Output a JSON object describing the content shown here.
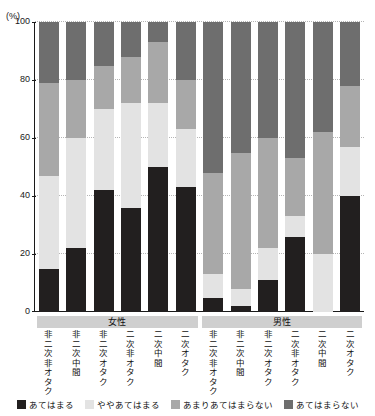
{
  "clipped_title": "",
  "axis": {
    "unit_label": "(%)",
    "y_ticks": [
      "100",
      "80",
      "60",
      "40",
      "20",
      "0"
    ],
    "y_min": 0,
    "y_max": 100
  },
  "groups": [
    {
      "label": "女性",
      "start": 0,
      "count": 6
    },
    {
      "label": "男性",
      "start": 6,
      "count": 6
    }
  ],
  "legend": {
    "items": [
      {
        "label": "あてはまる",
        "color": "#221f1f"
      },
      {
        "label": "ややあてはまる",
        "color": "#e3e3e3"
      },
      {
        "label": "あまりあてはまらない",
        "color": "#a8a8a8"
      },
      {
        "label": "あてはまらない",
        "color": "#6e6e6e"
      }
    ]
  },
  "chart_data": {
    "type": "bar",
    "subtype": "stacked-100",
    "title": "",
    "xlabel": "",
    "ylabel": "(%)",
    "ylim": [
      0,
      100
    ],
    "grid": true,
    "legend_position": "bottom",
    "categories": [
      "非二次非オタク",
      "非二次中間",
      "非二次オタク",
      "二次非オタク",
      "二次中間",
      "二次オタク",
      "非二次非オタク",
      "非二次中間",
      "非二次オタク",
      "二次非オタク",
      "二次中間",
      "二次オタク"
    ],
    "group_of_category": [
      "女性",
      "女性",
      "女性",
      "女性",
      "女性",
      "女性",
      "男性",
      "男性",
      "男性",
      "男性",
      "男性",
      "男性"
    ],
    "series": [
      {
        "name": "あてはまる",
        "color": "#221f1f",
        "values": [
          15,
          22,
          42,
          36,
          50,
          43,
          5,
          2,
          11,
          26,
          0,
          40
        ]
      },
      {
        "name": "ややあてはまる",
        "color": "#e3e3e3",
        "values": [
          32,
          38,
          28,
          36,
          22,
          20,
          8,
          6,
          11,
          7,
          20,
          17
        ]
      },
      {
        "name": "あまりあてはまらない",
        "color": "#a8a8a8",
        "values": [
          32,
          20,
          15,
          16,
          21,
          17,
          35,
          47,
          38,
          20,
          42,
          21
        ]
      },
      {
        "name": "あてはまらない",
        "color": "#6e6e6e",
        "values": [
          21,
          20,
          15,
          12,
          7,
          20,
          52,
          45,
          40,
          47,
          38,
          22
        ]
      }
    ]
  }
}
